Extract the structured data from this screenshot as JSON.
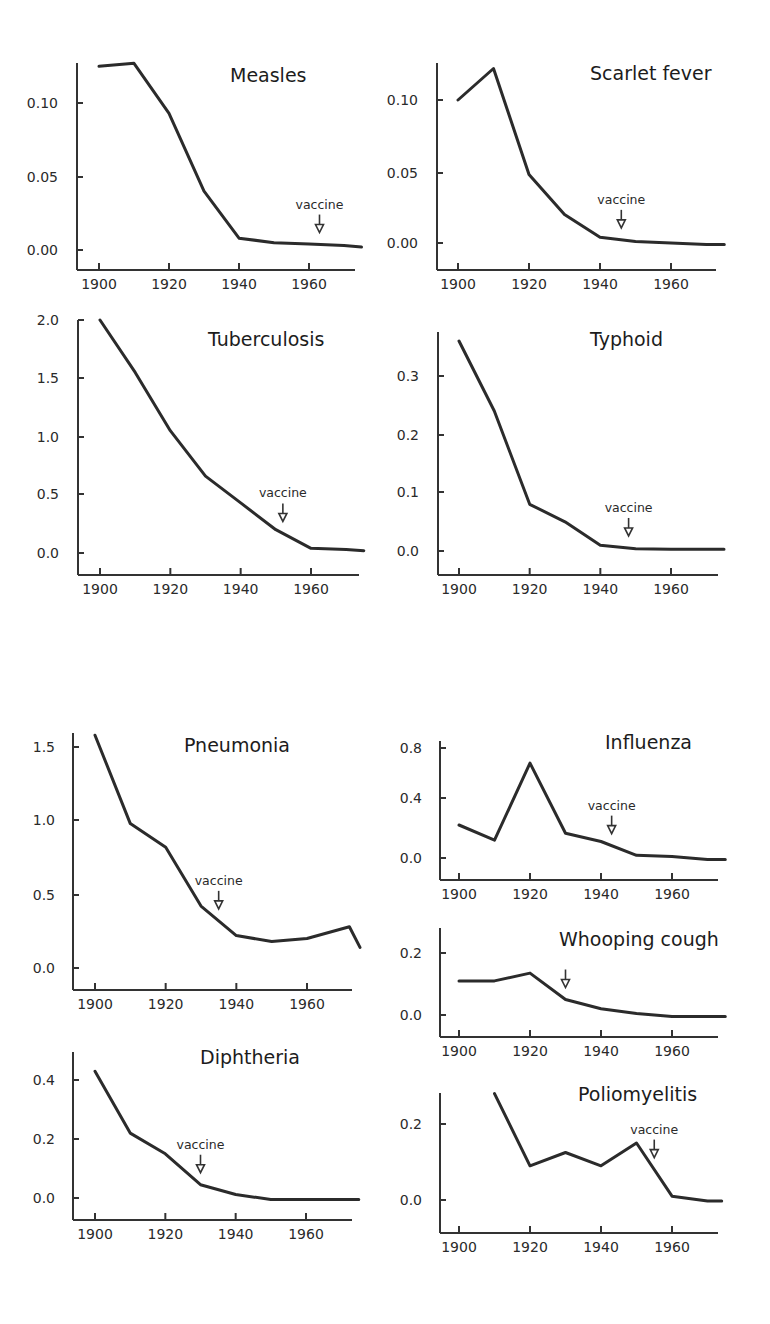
{
  "figure": {
    "panels_count": 9,
    "vaccine_label": "vaccine"
  },
  "chart_data": [
    {
      "type": "line",
      "title": "Measles",
      "x": [
        1900,
        1910,
        1920,
        1930,
        1940,
        1950,
        1960,
        1970,
        1975
      ],
      "values": [
        0.125,
        0.127,
        0.093,
        0.04,
        0.008,
        0.005,
        0.004,
        0.003,
        0.002
      ],
      "xticks": [
        1900,
        1920,
        1940,
        1960
      ],
      "yticks": [
        "0.00",
        "0.05",
        "0.10"
      ],
      "ylim": [
        -0.01,
        0.13
      ],
      "annotation": {
        "text": "vaccine",
        "x": 1963
      }
    },
    {
      "type": "line",
      "title": "Scarlet fever",
      "x": [
        1900,
        1910,
        1920,
        1930,
        1940,
        1950,
        1960,
        1970,
        1975
      ],
      "values": [
        0.1,
        0.122,
        0.048,
        0.02,
        0.004,
        0.001,
        0.0,
        -0.001,
        -0.001
      ],
      "xticks": [
        1900,
        1920,
        1940,
        1960
      ],
      "yticks": [
        "0.00",
        "0.05",
        "0.10"
      ],
      "ylim": [
        -0.01,
        0.13
      ],
      "annotation": {
        "text": "vaccine",
        "x": 1946
      }
    },
    {
      "type": "line",
      "title": "Tuberculosis",
      "x": [
        1900,
        1910,
        1920,
        1930,
        1940,
        1950,
        1960,
        1970,
        1975
      ],
      "values": [
        2.0,
        1.55,
        1.05,
        0.66,
        0.43,
        0.2,
        0.04,
        0.03,
        0.02
      ],
      "xticks": [
        1900,
        1920,
        1940,
        1960
      ],
      "yticks": [
        "0.0",
        "0.5",
        "1.0",
        "1.5",
        "2.0"
      ],
      "ylim": [
        -0.2,
        2.0
      ],
      "annotation": {
        "text": "vaccine",
        "x": 1952
      }
    },
    {
      "type": "line",
      "title": "Typhoid",
      "x": [
        1900,
        1910,
        1920,
        1930,
        1940,
        1950,
        1960,
        1970,
        1975
      ],
      "values": [
        0.36,
        0.24,
        0.08,
        0.05,
        0.01,
        0.004,
        0.003,
        0.003,
        0.003
      ],
      "xticks": [
        1900,
        1920,
        1940,
        1960
      ],
      "yticks": [
        "0.0",
        "0.1",
        "0.2",
        "0.3"
      ],
      "ylim": [
        -0.04,
        0.37
      ],
      "annotation": {
        "text": "vaccine",
        "x": 1948
      }
    },
    {
      "type": "line",
      "title": "Pneumonia",
      "x": [
        1900,
        1910,
        1920,
        1930,
        1940,
        1950,
        1960,
        1972,
        1975
      ],
      "values": [
        1.58,
        0.98,
        0.82,
        0.42,
        0.22,
        0.18,
        0.2,
        0.28,
        0.14
      ],
      "xticks": [
        1900,
        1920,
        1940,
        1960
      ],
      "yticks": [
        "0.0",
        "0.5",
        "1.0",
        "1.5"
      ],
      "ylim": [
        -0.15,
        1.6
      ],
      "annotation": {
        "text": "vaccine",
        "x": 1935
      }
    },
    {
      "type": "line",
      "title": "Influenza",
      "x": [
        1900,
        1910,
        1920,
        1930,
        1940,
        1950,
        1960,
        1970,
        1975
      ],
      "values": [
        0.24,
        0.13,
        0.69,
        0.18,
        0.12,
        0.02,
        0.01,
        -0.01,
        -0.01
      ],
      "xticks": [
        1900,
        1920,
        1940,
        1960
      ],
      "yticks": [
        "0.0",
        "0.4",
        "0.8"
      ],
      "ylim": [
        -0.15,
        0.8
      ],
      "annotation": {
        "text": "vaccine",
        "x": 1943
      }
    },
    {
      "type": "line",
      "title": "Whooping cough",
      "x": [
        1900,
        1910,
        1920,
        1930,
        1940,
        1950,
        1960,
        1970,
        1975
      ],
      "values": [
        0.11,
        0.11,
        0.135,
        0.05,
        0.02,
        0.005,
        -0.005,
        -0.005,
        -0.005
      ],
      "xticks": [
        1900,
        1920,
        1940,
        1960
      ],
      "yticks": [
        "0.0",
        "0.2"
      ],
      "ylim": [
        -0.07,
        0.25
      ],
      "annotation": {
        "text": "",
        "x": 1930
      }
    },
    {
      "type": "line",
      "title": "Diphtheria",
      "x": [
        1900,
        1910,
        1920,
        1930,
        1940,
        1950,
        1960,
        1970,
        1975
      ],
      "values": [
        0.43,
        0.22,
        0.15,
        0.045,
        0.012,
        -0.005,
        -0.005,
        -0.005,
        -0.005
      ],
      "xticks": [
        1900,
        1920,
        1940,
        1960
      ],
      "yticks": [
        "0.0",
        "0.2",
        "0.4"
      ],
      "ylim": [
        -0.07,
        0.47
      ],
      "annotation": {
        "text": "vaccine",
        "x": 1930
      }
    },
    {
      "type": "line",
      "title": "Poliomyelitis",
      "x": [
        1910,
        1920,
        1930,
        1940,
        1950,
        1960,
        1970,
        1974
      ],
      "values": [
        0.28,
        0.09,
        0.125,
        0.09,
        0.15,
        0.01,
        -0.003,
        -0.003
      ],
      "xticks": [
        1900,
        1920,
        1940,
        1960
      ],
      "yticks": [
        "0.0",
        "0.2"
      ],
      "ylim": [
        -0.04,
        0.3
      ],
      "annotation": {
        "text": "vaccine",
        "x": 1955
      }
    }
  ]
}
